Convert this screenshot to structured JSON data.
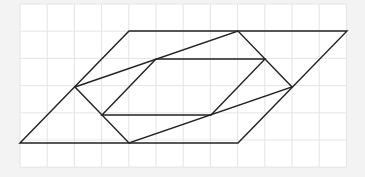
{
  "diagram": {
    "type": "geometry-grid-figure",
    "canvas": {
      "width": 365,
      "height": 177
    },
    "colors": {
      "background": "#f3f3f3",
      "grid_area": "#ffffff",
      "grid_line": "#e4e4e4",
      "stroke": "#222222"
    },
    "grid": {
      "origin_x": 20,
      "origin_y": 4,
      "cell": 27.2,
      "cols": 12,
      "rows": 6
    },
    "shapes": [
      {
        "name": "outer-parallelogram",
        "points": [
          [
            20,
            143
          ],
          [
            129,
            31
          ],
          [
            347,
            31
          ],
          [
            238,
            143
          ]
        ]
      },
      {
        "name": "middle-quadrilateral",
        "points": [
          [
            75,
            87
          ],
          [
            238,
            31
          ],
          [
            292,
            87
          ],
          [
            129,
            143
          ]
        ]
      },
      {
        "name": "inner-parallelogram",
        "points": [
          [
            102,
            115
          ],
          [
            156,
            59
          ],
          [
            265,
            59
          ],
          [
            211,
            115
          ]
        ]
      }
    ]
  }
}
